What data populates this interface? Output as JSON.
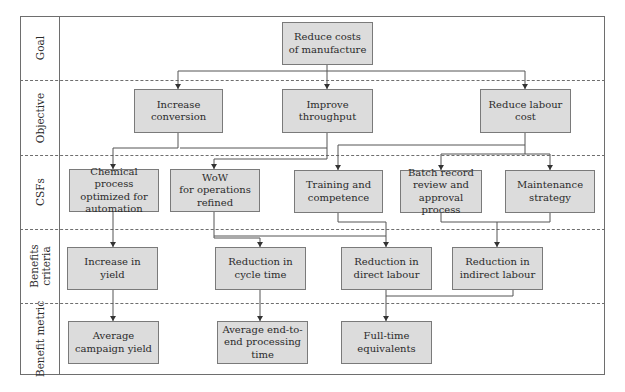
{
  "rows": [
    {
      "label": "Goal"
    },
    {
      "label": "Objective"
    },
    {
      "label": "CSFs"
    },
    {
      "label": "Benefits\ncriteria"
    },
    {
      "label": "Benefit metric"
    }
  ],
  "goal": {
    "text": "Reduce costs\nof manufacture"
  },
  "objectives": [
    {
      "text": "Increase\nconversion"
    },
    {
      "text": "Improve\nthroughput"
    },
    {
      "text": "Reduce labour\ncost"
    }
  ],
  "csfs": [
    {
      "text": "Chemical process\noptimized for\nautomation"
    },
    {
      "text": "WoW\nfor operations\nrefined"
    },
    {
      "text": "Training and\ncompetence"
    },
    {
      "text": "Batch record\nreview and\napproval process"
    },
    {
      "text": "Maintenance\nstrategy"
    }
  ],
  "benefits": [
    {
      "text": "Increase in\nyield"
    },
    {
      "text": "Reduction in\ncycle time"
    },
    {
      "text": "Reduction in\ndirect labour"
    },
    {
      "text": "Reduction in\nindirect labour"
    }
  ],
  "metrics": [
    {
      "text": "Average\ncampaign yield"
    },
    {
      "text": "Average end-to-\nend processing\ntime"
    },
    {
      "text": "Full-time\nequivalents"
    }
  ],
  "colors": {
    "box_fill": "#dcdcdc",
    "line": "#6e6e6e"
  }
}
